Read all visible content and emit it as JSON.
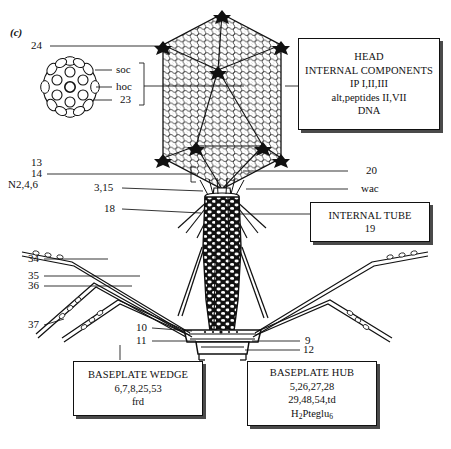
{
  "figure": {
    "panel_tag": "(c)",
    "line_color": "#111111",
    "box_shadow_color": "#4a4a4a"
  },
  "callouts": {
    "head_vertex": "24",
    "capsomer_soc": "soc",
    "capsomer_hoc": "hoc",
    "capsomer_major": "23",
    "neck_13": "13",
    "neck_14": "14",
    "neck_n246": "N2,4,6",
    "collar_315": "3,15",
    "sheath_18": "18",
    "right_20": "20",
    "right_wac": "wac",
    "fiber_34": "34",
    "fiber_35": "35",
    "fiber_36": "36",
    "fiber_37": "37",
    "baseplate_10": "10",
    "baseplate_11": "11",
    "baseplate_9": "9",
    "baseplate_12": "12"
  },
  "boxes": {
    "head": {
      "name": "head-internal-components",
      "lines": [
        "HEAD",
        "INTERNAL COMPONENTS",
        "IP I,II,III",
        "alt,peptides II,VII",
        "DNA"
      ]
    },
    "internal_tube": {
      "name": "internal-tube",
      "lines": [
        "INTERNAL TUBE",
        "19"
      ]
    },
    "baseplate_wedge": {
      "name": "baseplate-wedge",
      "lines": [
        "BASEPLATE WEDGE",
        "6,7,8,25,53",
        "frd"
      ]
    },
    "baseplate_hub": {
      "name": "baseplate-hub",
      "lines": [
        "BASEPLATE HUB",
        "5,26,27,28",
        "29,48,54,td"
      ],
      "formula_pre": "H",
      "formula_sub1": "2",
      "formula_mid": "Pteglu",
      "formula_sub2": "6"
    }
  }
}
